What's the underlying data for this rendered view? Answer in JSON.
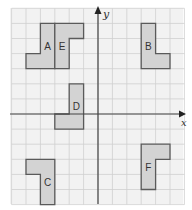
{
  "diagram": {
    "type": "coordinate-grid",
    "axes": {
      "x_label": "x",
      "y_label": "y",
      "x_range": [
        -6,
        6
      ],
      "y_range": [
        -6,
        7
      ]
    },
    "colors": {
      "background": "#f2f2f2",
      "grid_line": "#cfcfcf",
      "axis": "#444444",
      "shape_fill": "#d3d3d3",
      "shape_stroke": "#5a5a5a",
      "label": "#333333"
    },
    "shapes": [
      {
        "label": "A",
        "cells": [
          [
            -4,
            3,
            1,
            3
          ],
          [
            -5,
            3,
            1,
            1
          ]
        ],
        "label_pos": [
          -3.5,
          4.5
        ],
        "outline": [
          [
            -4,
            6
          ],
          [
            -3,
            6
          ],
          [
            -3,
            3
          ],
          [
            -5,
            3
          ],
          [
            -5,
            4
          ],
          [
            -4,
            4
          ]
        ]
      },
      {
        "label": "E",
        "cells": [
          [
            -3,
            3,
            1,
            3
          ],
          [
            -2,
            5,
            1,
            1
          ]
        ],
        "label_pos": [
          -2.5,
          4.5
        ],
        "outline": [
          [
            -3,
            6
          ],
          [
            -1,
            6
          ],
          [
            -1,
            5
          ],
          [
            -2,
            5
          ],
          [
            -2,
            3
          ],
          [
            -3,
            3
          ]
        ]
      },
      {
        "label": "B",
        "cells": [
          [
            3,
            3,
            1,
            3
          ],
          [
            4,
            3,
            1,
            1
          ]
        ],
        "label_pos": [
          3.5,
          4.5
        ],
        "outline": [
          [
            3,
            6
          ],
          [
            4,
            6
          ],
          [
            4,
            4
          ],
          [
            5,
            4
          ],
          [
            5,
            3
          ],
          [
            3,
            3
          ]
        ]
      },
      {
        "label": "D",
        "cells": [
          [
            -2,
            -1,
            1,
            3
          ],
          [
            -3,
            -1,
            1,
            1
          ]
        ],
        "label_pos": [
          -1.5,
          0.5
        ],
        "outline": [
          [
            -2,
            2
          ],
          [
            -1,
            2
          ],
          [
            -1,
            -1
          ],
          [
            -3,
            -1
          ],
          [
            -3,
            0
          ],
          [
            -2,
            0
          ]
        ]
      },
      {
        "label": "C",
        "cells": [
          [
            -4,
            -6,
            1,
            3
          ],
          [
            -5,
            -4,
            1,
            1
          ]
        ],
        "label_pos": [
          -3.5,
          -4.5
        ],
        "outline": [
          [
            -5,
            -3
          ],
          [
            -3,
            -3
          ],
          [
            -3,
            -6
          ],
          [
            -4,
            -6
          ],
          [
            -4,
            -4
          ],
          [
            -5,
            -4
          ]
        ]
      },
      {
        "label": "F",
        "cells": [
          [
            3,
            -5,
            1,
            3
          ],
          [
            4,
            -3,
            1,
            1
          ]
        ],
        "label_pos": [
          3.5,
          -3.5
        ],
        "outline": [
          [
            3,
            -2
          ],
          [
            5,
            -2
          ],
          [
            5,
            -3
          ],
          [
            4,
            -3
          ],
          [
            4,
            -5
          ],
          [
            3,
            -5
          ]
        ]
      }
    ]
  }
}
